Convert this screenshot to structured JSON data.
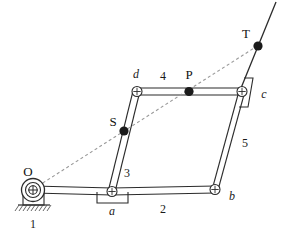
{
  "figure": {
    "type": "kinematic-linkage-diagram",
    "background": "#ffffff",
    "stroke_color": "#2b2b2b",
    "dash_color": "#9a9a9a",
    "joint_fill": "#ffffff",
    "point_fill": "#1a1a1a",
    "width": 285,
    "height": 248
  },
  "labels": {
    "O": "O",
    "S": "S",
    "P": "P",
    "T": "T",
    "a": "a",
    "b": "b",
    "c": "c",
    "d": "d",
    "link1": "1",
    "link2": "2",
    "link3": "3",
    "link4": "4",
    "link5": "5"
  },
  "geometry": {
    "ground_pivot_O": {
      "x": 33,
      "y": 190,
      "label": "O",
      "type": "fixed-pivot-with-ground"
    },
    "joint_a": {
      "x": 112,
      "y": 192,
      "label": "a",
      "type": "pin-joint-with-bracket"
    },
    "joint_b": {
      "x": 215,
      "y": 190,
      "label": "b",
      "type": "pin-joint"
    },
    "joint_c": {
      "x": 242,
      "y": 91,
      "label": "c",
      "type": "pin-joint-with-slanted-bracket"
    },
    "joint_d": {
      "x": 137,
      "y": 91,
      "label": "d",
      "type": "pin-joint"
    },
    "point_S": {
      "x": 124,
      "y": 131,
      "label": "S",
      "type": "coupler-point"
    },
    "point_P": {
      "x": 189,
      "y": 91,
      "label": "P",
      "type": "coupler-point"
    },
    "point_T": {
      "x": 258,
      "y": 46,
      "label": "T",
      "type": "coupler-point"
    }
  },
  "links": [
    {
      "id": "1",
      "name": "ground-link",
      "from": "O",
      "to": "a",
      "label": "1"
    },
    {
      "id": "2",
      "name": "link-2",
      "from": "a",
      "to": "b",
      "label": "2"
    },
    {
      "id": "3",
      "name": "link-3",
      "from": "a",
      "to": "d",
      "label": "3"
    },
    {
      "id": "4",
      "name": "link-4",
      "from": "d",
      "to": "c",
      "label": "4"
    },
    {
      "id": "5",
      "name": "link-5",
      "from": "b",
      "to": "c",
      "label": "5"
    }
  ],
  "dashed_line": {
    "name": "collinearity-line",
    "from": "O",
    "through": [
      "S",
      "P"
    ],
    "to": "T",
    "style": "dashed"
  },
  "solid_extension": {
    "name": "link-extension-line",
    "from": "b-c extended",
    "to": "top-right",
    "style": "solid"
  }
}
